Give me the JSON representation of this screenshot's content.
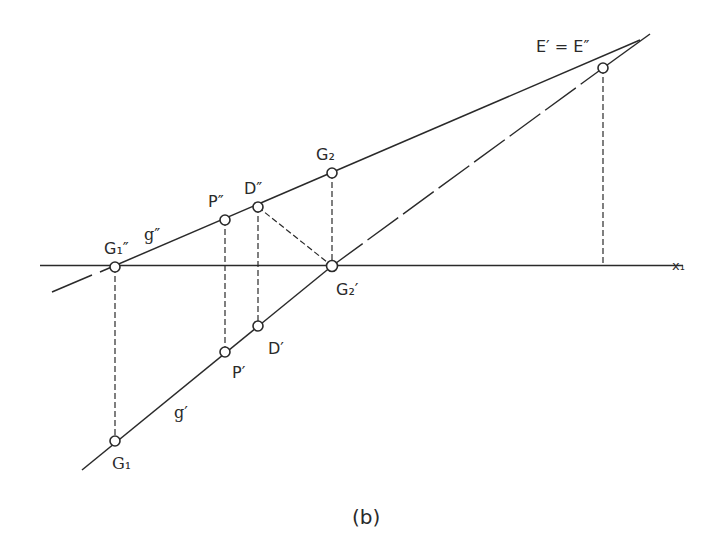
{
  "figure": {
    "caption": "(b)",
    "axis_label": "x₁",
    "lines": {
      "g_double_prime": "g″",
      "g_prime": "g′"
    },
    "points": {
      "E": "E′ = E″",
      "G2": "G₂",
      "G2_prime": "G₂′",
      "D_double_prime": "D″",
      "D_prime": "D′",
      "P_double_prime": "P″",
      "P_prime": "P′",
      "G1_double_prime": "G₁″",
      "G1": "G₁"
    }
  }
}
